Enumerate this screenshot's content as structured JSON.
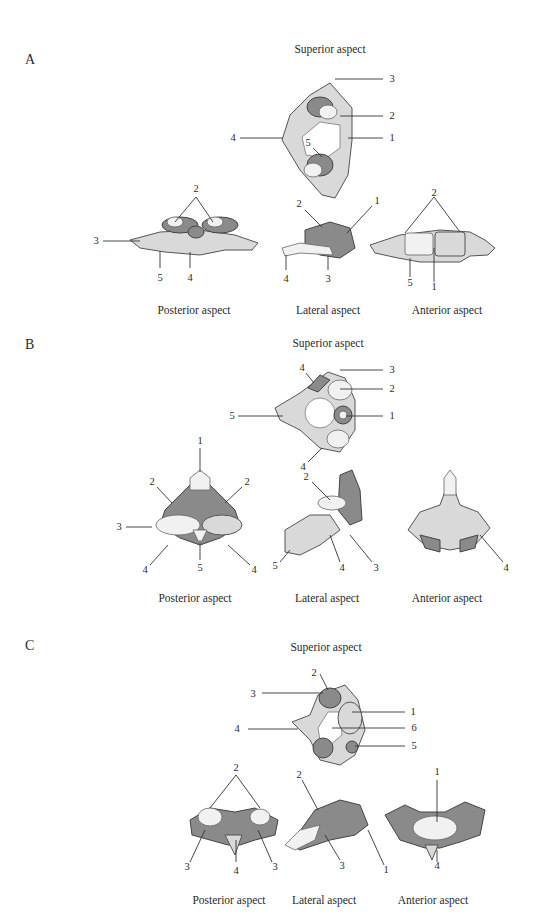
{
  "figure": {
    "panels": [
      {
        "letter": "A",
        "captions": {
          "superior": "Superior aspect",
          "posterior": "Posterior aspect",
          "lateral": "Lateral aspect",
          "anterior": "Anterior aspect"
        },
        "labels": {
          "superior": [
            "3",
            "2",
            "4",
            "1",
            "5"
          ],
          "posterior": [
            "2",
            "3",
            "5",
            "4"
          ],
          "lateral": [
            "2",
            "1",
            "4",
            "3"
          ],
          "anterior": [
            "2",
            "5",
            "1"
          ]
        }
      },
      {
        "letter": "B",
        "captions": {
          "superior": "Superior aspect",
          "posterior": "Posterior aspect",
          "lateral": "Lateral aspect",
          "anterior": "Anterior aspect"
        },
        "labels": {
          "superior": [
            "4",
            "3",
            "2",
            "5",
            "1",
            "4"
          ],
          "posterior": [
            "1",
            "2",
            "2",
            "3",
            "4",
            "5",
            "4"
          ],
          "lateral": [
            "2",
            "5",
            "4",
            "3"
          ],
          "anterior": [
            "4"
          ]
        }
      },
      {
        "letter": "C",
        "captions": {
          "superior": "Superior aspect",
          "posterior": "Posterior aspect",
          "lateral": "Lateral aspect",
          "anterior": "Anterior aspect"
        },
        "labels": {
          "superior": [
            "2",
            "3",
            "1",
            "4",
            "6",
            "5"
          ],
          "posterior": [
            "2",
            "3",
            "4",
            "3"
          ],
          "lateral": [
            "2",
            "3",
            "1"
          ],
          "anterior": [
            "1",
            "4"
          ]
        }
      }
    ]
  }
}
